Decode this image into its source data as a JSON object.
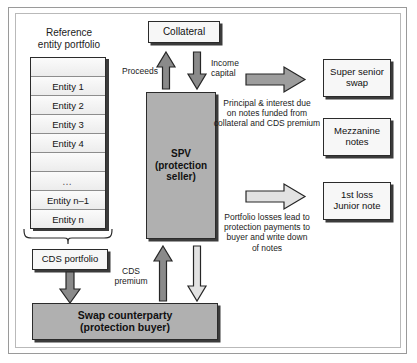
{
  "diagram": {
    "colors": {
      "box_light_fill": "#f7f7f7",
      "box_grey_fill": "#b0b0b0",
      "border": "#2b2b2b",
      "arrow_dark": "#8a8a8a",
      "arrow_light": "#e2e2e2",
      "frame": "#9a9a9a"
    },
    "labels": {
      "reference_portfolio_line1": "Reference",
      "reference_portfolio_line2": "entity portfolio",
      "proceeds": "Proceeds",
      "income_line1": "Income",
      "income_line2": "capital",
      "cds_premium_line1": "CDS",
      "cds_premium_line2": "premium",
      "principal_note_line1": "Principal & interest due",
      "principal_note_line2": "on notes funded  from",
      "principal_note_line3": "collateral and CDS premium",
      "losses_note_line1": "Portfolio losses  lead to",
      "losses_note_line2": "protection payments to",
      "losses_note_line3": "buyer and write down",
      "losses_note_line4": "of notes"
    },
    "entities": [
      "",
      "Entity 1",
      "Entity 2",
      "Entity 3",
      "Entity 4",
      "",
      "…",
      "Entity n–1",
      "Entity n"
    ],
    "nodes": {
      "collateral": "Collateral",
      "spv_line1": "SPV",
      "spv_line2": "(protection",
      "spv_line3": "seller)",
      "cds_portfolio": "CDS portfolio",
      "swap_counterparty_line1": "Swap counterparty",
      "swap_counterparty_line2": "(protection buyer)",
      "super_senior_line1": "Super senior",
      "super_senior_line2": "swap",
      "mezzanine_line1": "Mezzanine",
      "mezzanine_line2": "notes",
      "junior_line1": "1st loss",
      "junior_line2": "Junior note"
    }
  }
}
